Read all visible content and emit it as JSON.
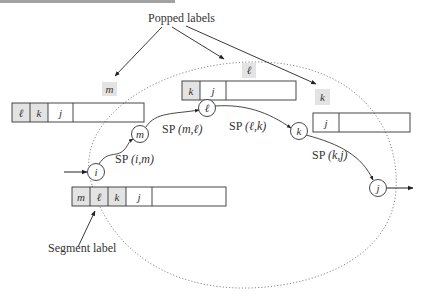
{
  "figure": {
    "heading_partial": "",
    "colors": {
      "stroke": "#333333",
      "label_fill": "#e3e3e3",
      "dotted": "#888888",
      "background": "#ffffff"
    }
  },
  "annotations": {
    "popped_labels": "Popped labels",
    "segment_label": "Segment label"
  },
  "popped": [
    {
      "text": "m"
    },
    {
      "text": "ℓ"
    },
    {
      "text": "k"
    }
  ],
  "label_lists": {
    "left": {
      "cells": [
        "ℓ",
        "k",
        "j",
        ""
      ]
    },
    "middle": {
      "cells": [
        "k",
        "j",
        ""
      ]
    },
    "right": {
      "cells": [
        "j",
        ""
      ]
    },
    "bottom": {
      "cells": [
        "m",
        "ℓ",
        "k",
        "j",
        ""
      ]
    }
  },
  "nodes": [
    {
      "id": "i",
      "text": "i"
    },
    {
      "id": "m",
      "text": "m"
    },
    {
      "id": "l",
      "text": "ℓ"
    },
    {
      "id": "k",
      "text": "k"
    },
    {
      "id": "j",
      "text": "j"
    }
  ],
  "edges": [
    {
      "label_prefix": "SP",
      "label_args": "(i,m)"
    },
    {
      "label_prefix": "SP",
      "label_args": "(m,ℓ)"
    },
    {
      "label_prefix": "SP",
      "label_args": "(ℓ,k)"
    },
    {
      "label_prefix": "SP",
      "label_args": "(k,j)"
    }
  ]
}
